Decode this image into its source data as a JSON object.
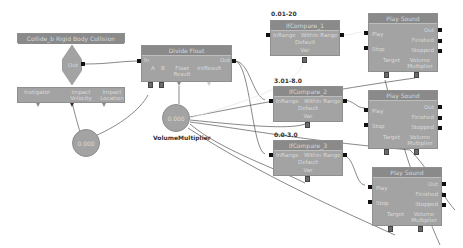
{
  "event_node": {
    "title": "Collide_b Rigid Body Collision",
    "out_label": "Out",
    "vars": [
      "Instigator",
      "Impact Velocity",
      "Impact Location"
    ]
  },
  "impact_var": {
    "value": "0.000"
  },
  "divide_node": {
    "title": "Divide Float",
    "in_label": "In",
    "out_label": "Out",
    "vars": [
      "A",
      "B",
      "Float Result",
      "IntResult"
    ]
  },
  "volume_var": {
    "value": "0.000",
    "label": "VolumeMultiplier"
  },
  "compare_nodes": [
    {
      "range_label": "0.01-20",
      "title": "IfCompare_1",
      "in_label": "InRange",
      "out_label": "Within Range",
      "default_label": "Default",
      "var_label": "Var"
    },
    {
      "range_label": "3.01-8.0",
      "title": "IfCompare_2",
      "in_label": "InRange",
      "out_label": "Within Range",
      "default_label": "Default",
      "var_label": "Var"
    },
    {
      "range_label": "0.0-3.0",
      "title": "IfCompare_3",
      "in_label": "InRange",
      "out_label": "Within Range",
      "default_label": "Default",
      "var_label": "Var"
    }
  ],
  "sound_nodes": [
    {
      "title": "Play Sound",
      "play": "Play",
      "stop": "Stop",
      "out": "Out",
      "finished": "Finished",
      "stopped": "Stopped",
      "target": "Target",
      "volume": "Volume Multiplier"
    },
    {
      "title": "Play Sound",
      "play": "Play",
      "stop": "Stop",
      "out": "Out",
      "finished": "Finished",
      "stopped": "Stopped",
      "target": "Target",
      "volume": "Volume Multiplier"
    },
    {
      "title": "Play Sound",
      "play": "Play",
      "stop": "Stop",
      "out": "Out",
      "finished": "Finished",
      "stopped": "Stopped",
      "target": "Target",
      "volume": "Volume Multiplier"
    }
  ]
}
